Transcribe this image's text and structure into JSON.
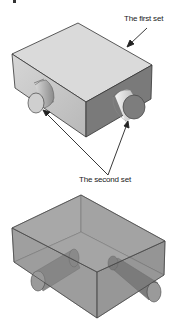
{
  "figure": {
    "top_view": {
      "description": "opaque box with two cylindrical bosses",
      "callout_first": "The first set",
      "callout_second": "The second set"
    },
    "bottom_view": {
      "description": "transparent box showing cylinders passing through"
    },
    "colors": {
      "top_face": "#d9d9d9",
      "left_face": "#c4c4c4",
      "right_face": "#777777",
      "transparent_box": "#9a9a9a",
      "edge": "#333333"
    }
  }
}
